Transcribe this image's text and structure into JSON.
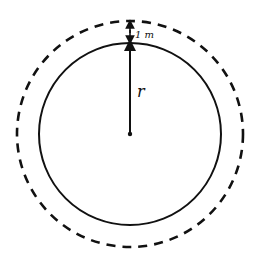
{
  "diagram": {
    "inner_circle": {
      "cx": 130,
      "cy": 134,
      "r": 91,
      "style": "solid"
    },
    "outer_circle": {
      "cx": 130,
      "cy": 134,
      "r": 113,
      "style": "dashed"
    },
    "radius_label": "r",
    "gap_label": "1 m",
    "stroke_color": "#111111"
  }
}
